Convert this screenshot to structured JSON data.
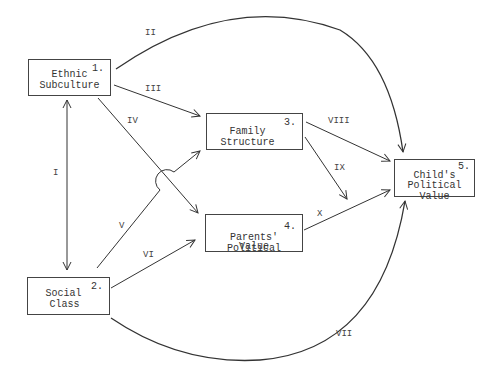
{
  "diagram": {
    "type": "path-model",
    "nodes": [
      {
        "id": 1,
        "number": "1.",
        "line1": "Ethnic",
        "line2": "Subculture"
      },
      {
        "id": 2,
        "number": "2.",
        "line1": "Social",
        "line2": "Class"
      },
      {
        "id": 3,
        "number": "3.",
        "line1": "Family",
        "line2": "Structure"
      },
      {
        "id": 4,
        "number": "4.",
        "line1": "Parents' Political",
        "line2": "Value"
      },
      {
        "id": 5,
        "number": "5.",
        "line1": "Child's",
        "line2": "Political Value"
      }
    ],
    "paths": [
      {
        "label": "I",
        "from": 1,
        "to": 2,
        "bidirectional": true
      },
      {
        "label": "II",
        "from": 1,
        "to": 5
      },
      {
        "label": "III",
        "from": 1,
        "to": 3
      },
      {
        "label": "IV",
        "from": 1,
        "to": 4
      },
      {
        "label": "V",
        "from": 2,
        "to": 3
      },
      {
        "label": "VI",
        "from": 2,
        "to": 4
      },
      {
        "label": "VII",
        "from": 2,
        "to": 5
      },
      {
        "label": "VIII",
        "from": 3,
        "to": 5
      },
      {
        "label": "IX",
        "from": 3,
        "to": "path X"
      },
      {
        "label": "X",
        "from": 4,
        "to": 5
      }
    ],
    "colors": {
      "line": "#333333",
      "background": "#ffffff"
    }
  }
}
